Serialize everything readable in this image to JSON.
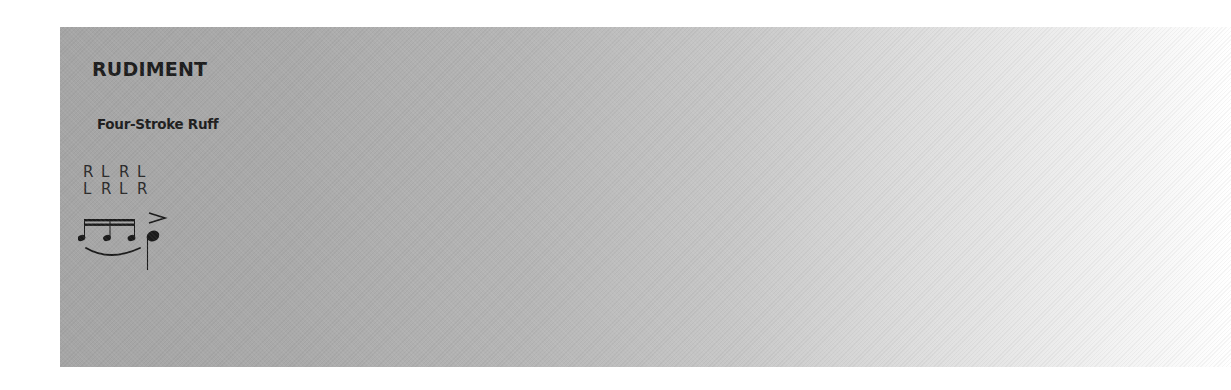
{
  "rudiment": {
    "heading": "RUDIMENT",
    "name": "Four-Stroke Ruff",
    "sticking": {
      "row1": [
        "R",
        "L",
        "R",
        "L"
      ],
      "row2": [
        "L",
        "R",
        "L",
        "R"
      ]
    },
    "notation": {
      "grace_notes": 3,
      "beams": 2,
      "main_note_accent": "accent",
      "slur": true
    },
    "colors": {
      "panel_gradient_start": "#a5a5a5",
      "panel_gradient_end": "#ffffff",
      "text": "#1d1d1d"
    }
  }
}
